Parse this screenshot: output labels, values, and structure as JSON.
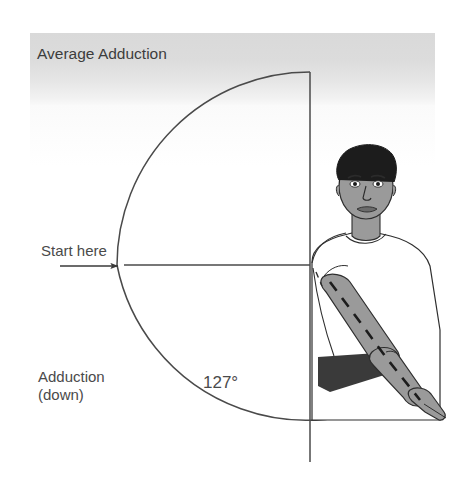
{
  "diagram": {
    "title": "Average Adduction",
    "start_label": "Start here",
    "motion_label": "Adduction\n(down)",
    "angle_label": "127°",
    "angle_value": 127,
    "icons": {
      "start_arrow": "arrow-right-icon",
      "rotation_arrow": "arc-arrow-icon"
    },
    "colors": {
      "line": "#4a4a4a",
      "text": "#4a4a4a",
      "band_top": "#d9d9d9",
      "skin": "#9a9a9a",
      "hair": "#1c1c1c",
      "shirt": "#ffffff",
      "shadow": "#3a3a3a",
      "background": "#ffffff"
    },
    "geometry": {
      "pivot_x": 310,
      "pivot_y": 265,
      "radius": 193,
      "arc_start_deg": 180,
      "arc_end_deg": 307
    },
    "figure": {
      "name": "male-torso-illustration",
      "description": "Front-facing male figure with right arm adducted downward across the body"
    }
  }
}
